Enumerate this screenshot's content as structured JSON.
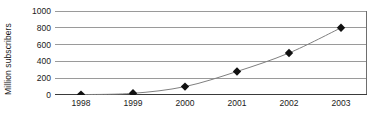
{
  "chart_data": {
    "type": "line",
    "title": "",
    "subtitle": "",
    "xlabel": "",
    "ylabel": "Million subscribers",
    "categories": [
      "1998",
      "1999",
      "2000",
      "2001",
      "2002",
      "2003"
    ],
    "values": [
      5,
      20,
      100,
      280,
      500,
      800
    ],
    "series": [
      {
        "name": "Million subscribers",
        "values": [
          5,
          20,
          100,
          280,
          500,
          800
        ]
      }
    ],
    "ylim": [
      0,
      1000
    ],
    "yticks": [
      0,
      200,
      400,
      600,
      800,
      1000
    ],
    "ytick_labels": [
      "0",
      "200",
      "400",
      "600",
      "800",
      "1000"
    ],
    "xtick_labels": [
      "1998",
      "1999",
      "2000",
      "2001",
      "2002",
      "2003"
    ],
    "grid": "horizontal",
    "legend": "none",
    "marker": "diamond",
    "marker_color": "#111111",
    "line_color": "#808080",
    "gridline_color": "#9a9a9a",
    "axis_color": "#6e6e6e",
    "background": "#ffffff",
    "annotations": []
  }
}
